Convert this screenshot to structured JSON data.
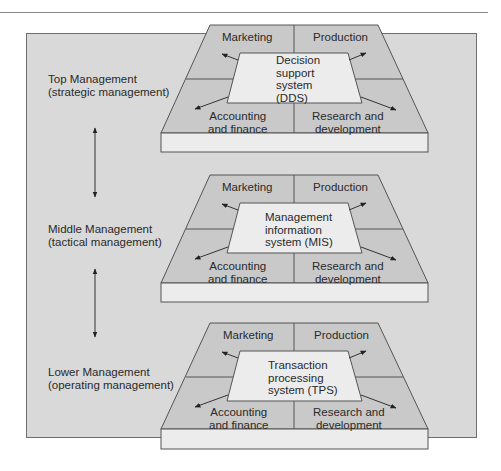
{
  "diagram": {
    "colors": {
      "background_box": "#d9d9d9",
      "platform_section": "#c9c9c9",
      "system_panel": "#ececec",
      "slab": "#ececec",
      "stroke": "#555555"
    },
    "levels": [
      {
        "label_line1": "Top Management",
        "label_line2": "(strategic management)",
        "system_lines": [
          "Decision",
          "support",
          "system",
          "(DDS)"
        ],
        "departments": {
          "top_left": "Marketing",
          "top_right": "Production",
          "bottom_left_1": "Accounting",
          "bottom_left_2": "and finance",
          "bottom_right_1": "Research and",
          "bottom_right_2": "development"
        }
      },
      {
        "label_line1": "Middle Management",
        "label_line2": "(tactical management)",
        "system_lines": [
          "Management",
          "information",
          "system (MIS)"
        ],
        "departments": {
          "top_left": "Marketing",
          "top_right": "Production",
          "bottom_left_1": "Accounting",
          "bottom_left_2": "and finance",
          "bottom_right_1": "Research and",
          "bottom_right_2": "development"
        }
      },
      {
        "label_line1": "Lower Management",
        "label_line2": "(operating management)",
        "system_lines": [
          "Transaction",
          "processing",
          "system (TPS)"
        ],
        "departments": {
          "top_left": "Marketing",
          "top_right": "Production",
          "bottom_left_1": "Accounting",
          "bottom_left_2": "and finance",
          "bottom_right_1": "Research and",
          "bottom_right_2": "development"
        }
      }
    ],
    "connectors": [
      {
        "from": "Top Management",
        "to": "Middle Management",
        "type": "double-arrow"
      },
      {
        "from": "Middle Management",
        "to": "Lower Management",
        "type": "double-arrow"
      }
    ]
  }
}
